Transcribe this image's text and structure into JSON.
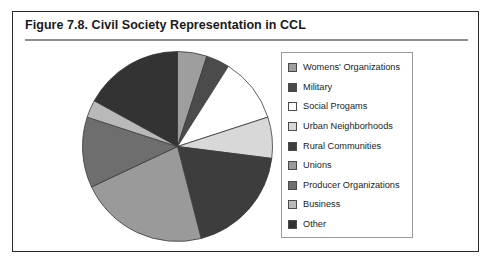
{
  "figure": {
    "title": "Figure 7.8.  Civil Society Representation in CCL",
    "frame_color": "#2a2a2a",
    "rule_color": "#8d8d8d"
  },
  "legend": {
    "position": "right",
    "border_color": "#9a9a9a",
    "items": [
      {
        "label": "Womens' Organizations",
        "color": "#9e9e9e"
      },
      {
        "label": "Military",
        "color": "#4b4b4b"
      },
      {
        "label": "Social Progams",
        "color": "#ffffff"
      },
      {
        "label": "Urban Neighborhoods",
        "color": "#d8d8d8"
      },
      {
        "label": "Rural Communities",
        "color": "#3d3d3d"
      },
      {
        "label": "Unions",
        "color": "#9a9a9a"
      },
      {
        "label": "Producer Organizations",
        "color": "#6e6e6e"
      },
      {
        "label": "Business",
        "color": "#b9b9b9"
      },
      {
        "label": "Other",
        "color": "#333333"
      }
    ]
  },
  "chart_data": {
    "type": "pie",
    "title": "Figure 7.8.  Civil Society Representation in CCL",
    "xlabel": "",
    "ylabel": "",
    "grid": false,
    "legend_position": "right",
    "start_angle_deg": 0,
    "direction": "clockwise",
    "center": {
      "x": 96.5,
      "y": 96.5
    },
    "radius": 95,
    "categories": [
      "Womens' Organizations",
      "Military",
      "Social Progams",
      "Urban Neighborhoods",
      "Rural Communities",
      "Unions",
      "Producer Organizations",
      "Business",
      "Other"
    ],
    "values": [
      5.0,
      4.0,
      11.0,
      7.0,
      19.0,
      22.0,
      12.0,
      3.0,
      17.0
    ],
    "colors": [
      "#9e9e9e",
      "#4b4b4b",
      "#ffffff",
      "#d8d8d8",
      "#3d3d3d",
      "#9a9a9a",
      "#6e6e6e",
      "#b9b9b9",
      "#333333"
    ],
    "slice_border_color": "#3a3a3a",
    "slice_border_width": 0.8
  }
}
